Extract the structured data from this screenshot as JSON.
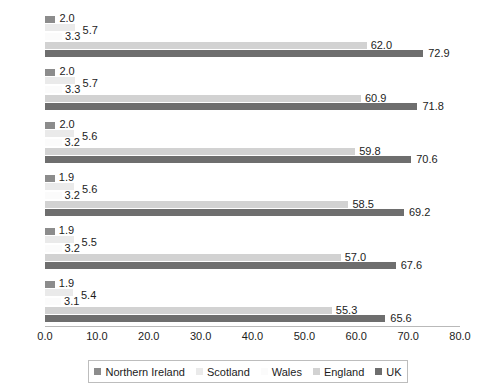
{
  "chart_data": {
    "type": "bar",
    "orientation": "horizontal",
    "title": "",
    "xlabel": "",
    "ylabel": "",
    "xlim": [
      0.0,
      80.0
    ],
    "grid": false,
    "legend_position": "bottom",
    "categories": [
      "2041",
      "2036",
      "2031",
      "2026",
      "2021",
      "2016"
    ],
    "xticks": [
      "0.0",
      "10.0",
      "20.0",
      "30.0",
      "40.0",
      "50.0",
      "60.0",
      "70.0",
      "80.0"
    ],
    "xtick_values": [
      0.0,
      10.0,
      20.0,
      30.0,
      40.0,
      50.0,
      60.0,
      70.0,
      80.0
    ],
    "series": [
      {
        "name": "Northern Ireland",
        "color": "#8c8c8c",
        "values": [
          2.0,
          2.0,
          2.0,
          1.9,
          1.9,
          1.9
        ],
        "labels": [
          "2.0",
          "2.0",
          "2.0",
          "1.9",
          "1.9",
          "1.9"
        ]
      },
      {
        "name": "Scotland",
        "color": "#eaeaea",
        "values": [
          5.7,
          5.7,
          5.6,
          5.6,
          5.5,
          5.4
        ],
        "labels": [
          "5.7",
          "5.7",
          "5.6",
          "5.6",
          "5.5",
          "5.4"
        ]
      },
      {
        "name": "Wales",
        "color": "#fbfbfb",
        "values": [
          3.3,
          3.3,
          3.2,
          3.2,
          3.2,
          3.1
        ],
        "labels": [
          "3.3",
          "3.3",
          "3.2",
          "3.2",
          "3.2",
          "3.1"
        ]
      },
      {
        "name": "England",
        "color": "#d2d2d2",
        "values": [
          62.0,
          60.9,
          59.8,
          58.5,
          57.0,
          55.3
        ],
        "labels": [
          "62.0",
          "60.9",
          "59.8",
          "58.5",
          "57.0",
          "55.3"
        ]
      },
      {
        "name": "UK",
        "color": "#6e6e6e",
        "values": [
          72.9,
          71.8,
          70.6,
          69.2,
          67.6,
          65.6
        ],
        "labels": [
          "72.9",
          "71.8",
          "70.6",
          "69.2",
          "67.6",
          "65.6"
        ]
      }
    ]
  },
  "legend": {
    "items": [
      {
        "label": "Northern Ireland",
        "color": "#8c8c8c"
      },
      {
        "label": "Scotland",
        "color": "#eaeaea"
      },
      {
        "label": "Wales",
        "color": "#fbfbfb"
      },
      {
        "label": "England",
        "color": "#d2d2d2"
      },
      {
        "label": "UK",
        "color": "#6e6e6e"
      }
    ]
  }
}
